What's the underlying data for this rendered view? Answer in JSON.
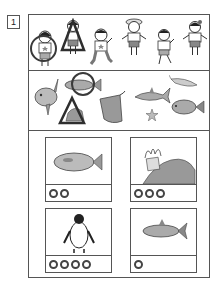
{
  "question": {
    "number": "1"
  },
  "section1": {
    "description": "Row of six children",
    "figures": [
      {
        "type": "girl",
        "mark": "circle"
      },
      {
        "type": "girl",
        "mark": "triangle"
      },
      {
        "type": "boy",
        "mark": null
      },
      {
        "type": "girl-with-hat",
        "mark": null
      },
      {
        "type": "boy",
        "mark": null
      },
      {
        "type": "girl-with-bow",
        "mark": null
      }
    ]
  },
  "section2": {
    "description": "Sea creatures",
    "figures": [
      {
        "type": "sunfish",
        "mark": null
      },
      {
        "type": "fish",
        "mark": "circle"
      },
      {
        "type": "crab",
        "mark": "triangle"
      },
      {
        "type": "stingray",
        "mark": null
      },
      {
        "type": "shark",
        "mark": null
      },
      {
        "type": "starfish",
        "mark": null
      },
      {
        "type": "shrimp",
        "mark": null
      },
      {
        "type": "sea-bream",
        "mark": null
      }
    ]
  },
  "section3": {
    "cards": [
      {
        "picture": "flounder",
        "ring_count": 2
      },
      {
        "picture": "sea-anemone",
        "ring_count": 3
      },
      {
        "picture": "penguin",
        "ring_count": 4
      },
      {
        "picture": "tuna",
        "ring_count": 1
      }
    ]
  },
  "colors": {
    "line": "#555555",
    "mark": "#3a3a3a",
    "ring": "#444444"
  }
}
